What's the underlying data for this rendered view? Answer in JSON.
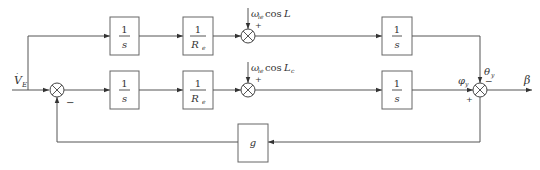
{
  "diagram": {
    "type": "block-diagram",
    "input_label": "V̇_E",
    "output_label": "β",
    "blocks": [
      {
        "id": "int-top-1",
        "numerator": "1",
        "denominator": "s"
      },
      {
        "id": "re-top",
        "numerator": "1",
        "denominator": "R_e"
      },
      {
        "id": "int-top-2",
        "numerator": "1",
        "denominator": "s"
      },
      {
        "id": "int-bot-1",
        "numerator": "1",
        "denominator": "s"
      },
      {
        "id": "re-bot",
        "numerator": "1",
        "denominator": "R_e"
      },
      {
        "id": "int-bot-2",
        "numerator": "1",
        "denominator": "s"
      },
      {
        "id": "gain-g",
        "label": "g"
      }
    ],
    "summing_junctions": [
      {
        "id": "sum-left",
        "signs": {
          "feedback": "−"
        }
      },
      {
        "id": "sum-top",
        "external_input": "ω_ie cosL",
        "sign": "+"
      },
      {
        "id": "sum-bot",
        "external_input": "ω_ie cosL_c",
        "sign": "+"
      },
      {
        "id": "sum-right",
        "inputs": [
          {
            "label": "φ_y",
            "sign": "+"
          },
          {
            "label": "θ_y",
            "sign": "−"
          }
        ]
      }
    ],
    "labels": {
      "v": "V",
      "v_sub": "E",
      "omega_top": "ω",
      "omega_top_sub": "ie",
      "cos_top": "cos",
      "L_top": "L",
      "omega_bot": "ω",
      "omega_bot_sub": "ie",
      "cos_bot": "cos",
      "L_bot": "L",
      "L_bot_sub": "c",
      "phi": "φ",
      "phi_sub": "y",
      "theta": "θ",
      "theta_sub": "y",
      "beta": "β",
      "plus": "+",
      "minus": "−",
      "one": "1",
      "s": "s",
      "R": "R",
      "R_sub": "e",
      "g": "g"
    }
  }
}
